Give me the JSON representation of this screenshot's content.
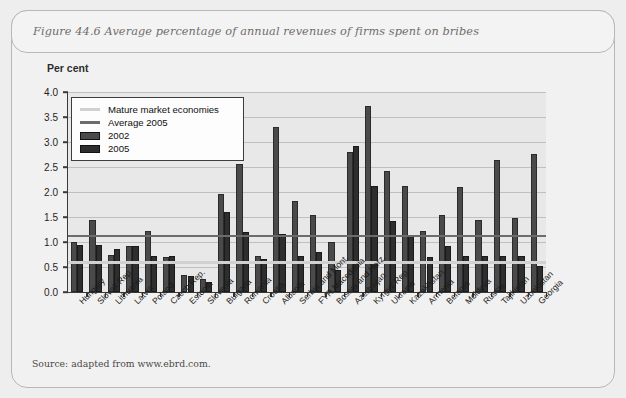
{
  "figure": {
    "title": "Figure 44.6  Average percentage of annual revenues of firms spent on bribes",
    "source": "Source: adapted from www.ebrd.com.",
    "axis_unit_label": "Per cent"
  },
  "legend": {
    "items": [
      {
        "label": "Mature market economies",
        "key": "line",
        "color": "#d2d1d1"
      },
      {
        "label": "Average 2005",
        "key": "line",
        "color": "#6d6c6c"
      },
      {
        "label": "2002",
        "key": "swatch",
        "color": "#4a4a4a"
      },
      {
        "label": "2005",
        "key": "swatch",
        "color": "#2e2e2e"
      }
    ]
  },
  "chart_data": {
    "type": "bar",
    "title": "Figure 44.6  Average percentage of annual revenues of firms spent on bribes",
    "xlabel": "",
    "ylabel": "Per cent",
    "ylim": [
      0.0,
      4.0
    ],
    "ytick_labels": [
      "0.0",
      "0.5",
      "1.0",
      "1.5",
      "2.0",
      "2.5",
      "3.0",
      "3.5",
      "4.0"
    ],
    "ytick_values": [
      0.0,
      0.5,
      1.0,
      1.5,
      2.0,
      2.5,
      3.0,
      3.5,
      4.0
    ],
    "grid": true,
    "legend_position": "top-left",
    "categories": [
      "Hungary",
      "Slovak Rep.",
      "Lithuania",
      "Latvia",
      "Poland",
      "Czech Rep.",
      "Estonia",
      "Slovenia",
      "Bulgaria",
      "Romania",
      "Croatia",
      "Albania",
      "Serbia and Mont.",
      "FYR Macedonia",
      "Bosnia and Herz.",
      "Azerbaijan",
      "Kyrgyz Rep.",
      "Ukraine",
      "Kazakhstan",
      "Armenia",
      "Belarus",
      "Moldova",
      "Russia",
      "Tajikistan",
      "Uzbekistan",
      "Georgia"
    ],
    "series": [
      {
        "name": "2002",
        "color": "#4a4a4a",
        "values": [
          1.0,
          1.45,
          0.75,
          0.92,
          1.22,
          0.7,
          0.35,
          0.27,
          1.97,
          2.57,
          0.72,
          3.3,
          1.82,
          1.55,
          1.0,
          2.8,
          3.72,
          2.42,
          2.12,
          1.22,
          1.55,
          2.1,
          1.45,
          2.65,
          1.48,
          2.77
        ],
        "value_unit": "per cent"
      },
      {
        "name": "2005",
        "color": "#2e2e2e",
        "values": [
          0.95,
          0.95,
          0.87,
          0.92,
          0.72,
          0.72,
          0.32,
          0.2,
          1.6,
          1.2,
          0.67,
          1.17,
          0.72,
          0.8,
          0.45,
          2.92,
          2.12,
          1.42,
          1.12,
          0.7,
          0.92,
          0.72,
          0.72,
          0.72,
          0.72,
          0.52
        ],
        "value_unit": "per cent"
      }
    ],
    "reference_lines": [
      {
        "name": "Mature market economies",
        "value": 0.62,
        "color": "#d2d1d1"
      },
      {
        "name": "Average 2005",
        "value": 1.15,
        "color": "#6d6c6c"
      }
    ]
  }
}
